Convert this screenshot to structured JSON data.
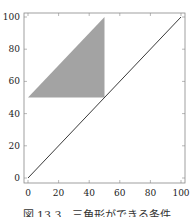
{
  "chart_data": {
    "type": "line",
    "title": "",
    "xlabel": "",
    "ylabel": "",
    "xlim": [
      0,
      100
    ],
    "ylim": [
      0,
      100
    ],
    "grid": false,
    "x_ticks": [
      "0",
      "20",
      "40",
      "60",
      "80",
      "100"
    ],
    "y_ticks": [
      "0",
      "20",
      "40",
      "60",
      "80",
      "100"
    ],
    "series": [
      {
        "name": "diagonal y=x",
        "type": "line",
        "x": [
          0,
          100
        ],
        "y": [
          0,
          100
        ],
        "color": "#222222"
      }
    ],
    "shapes": [
      {
        "name": "feasible-triangle",
        "type": "polygon",
        "points": [
          [
            0,
            50
          ],
          [
            50,
            50
          ],
          [
            50,
            100
          ]
        ],
        "fill": "#a3a3a3"
      }
    ]
  },
  "caption": "図 13.3　三角形ができる条件"
}
